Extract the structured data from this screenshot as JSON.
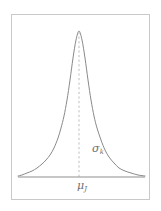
{
  "figure": {
    "frame": {
      "border_color": "#c9c9c9",
      "background_color": "#ffffff"
    },
    "annotations": {
      "sigma": {
        "symbol": "σ",
        "subscript": "k",
        "full": "σk",
        "role": "standard-deviation-label"
      },
      "mu": {
        "symbol": "μ",
        "subscript": "J",
        "full": "μJ",
        "role": "mean-label"
      }
    },
    "styles": {
      "curve_color": "#8a8a8a",
      "axis_color": "#8f8f8f",
      "dashed_line_color": "#bdbdbd",
      "label_color": "#6f6f6f"
    }
  },
  "chart_data": {
    "type": "line",
    "title": "",
    "subtitle": "",
    "xlabel": "",
    "ylabel": "",
    "grid": false,
    "legend": null,
    "axis_line": {
      "x_start": 18,
      "x_end": 145,
      "y": 177
    },
    "peak": {
      "x": 79,
      "y": 31
    },
    "mean_marker": {
      "x": 79,
      "y_top": 31,
      "y_bottom": 177,
      "style": "dashed",
      "label": "μJ"
    },
    "spread_marker": {
      "label": "σk",
      "x": 95,
      "y": 150
    },
    "xlim": [
      18,
      145
    ],
    "ylim": [
      177,
      31
    ],
    "x": [
      18,
      22,
      27,
      32,
      37,
      42,
      46,
      50,
      54,
      58,
      61,
      64,
      67,
      70,
      73,
      76,
      79,
      82,
      85,
      88,
      91,
      94,
      97,
      101,
      105,
      109,
      114,
      119,
      125,
      131,
      138,
      145
    ],
    "y": [
      176,
      175,
      173,
      171,
      168,
      164,
      160,
      155,
      148,
      138,
      128,
      116,
      100,
      80,
      58,
      40,
      31,
      40,
      58,
      80,
      100,
      116,
      128,
      140,
      150,
      157,
      163,
      168,
      171,
      173,
      175,
      176
    ],
    "series": [
      {
        "name": "density",
        "values": [
          176,
          175,
          173,
          171,
          168,
          164,
          160,
          155,
          148,
          138,
          128,
          116,
          100,
          80,
          58,
          40,
          31,
          40,
          58,
          80,
          100,
          116,
          128,
          140,
          150,
          157,
          163,
          168,
          171,
          173,
          175,
          176
        ]
      }
    ]
  }
}
